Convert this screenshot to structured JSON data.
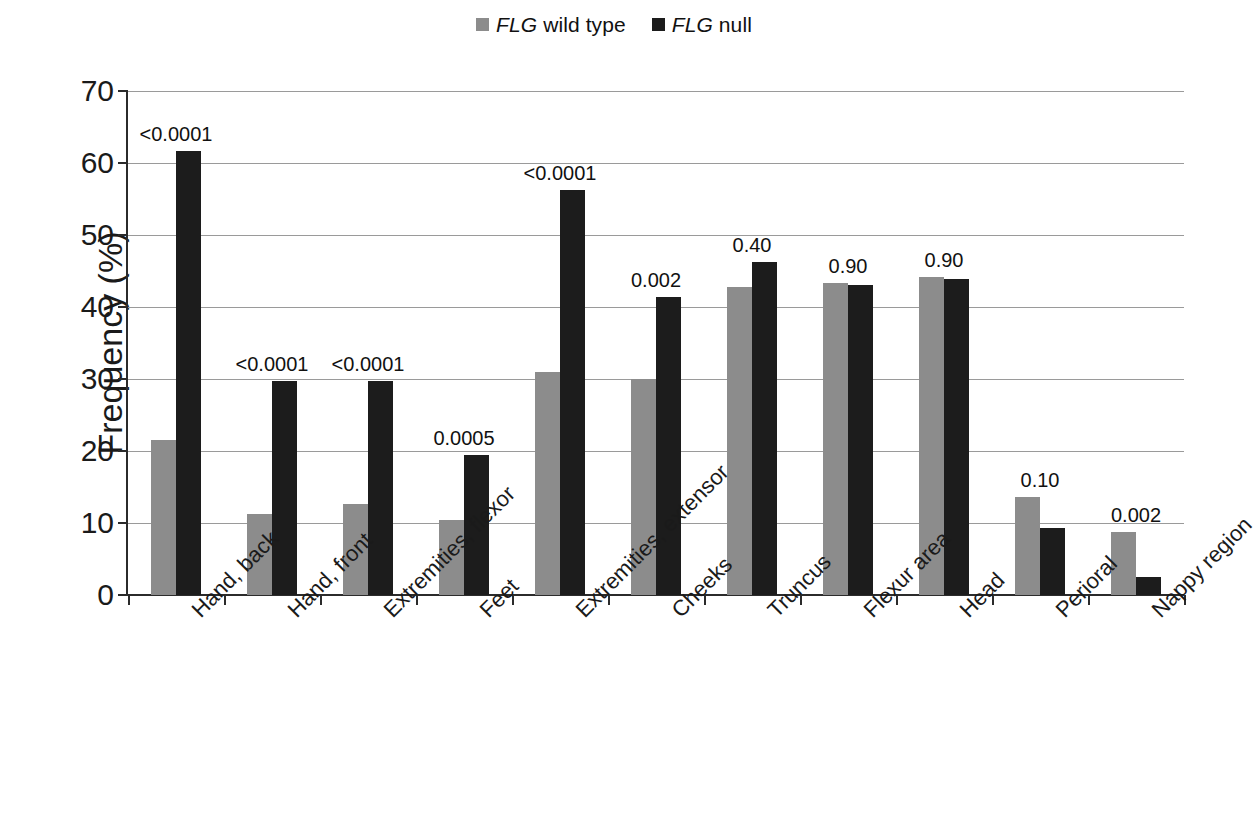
{
  "legend": {
    "items": [
      {
        "gene": "FLG",
        "rest": " wild type",
        "color": "#8c8c8c",
        "name": "legend-wild-type"
      },
      {
        "gene": "FLG",
        "rest": " null",
        "color": "#1c1c1c",
        "name": "legend-null"
      }
    ]
  },
  "axes": {
    "ylabel": "Frequency (%)",
    "yticks": [
      "0",
      "10",
      "20",
      "30",
      "40",
      "50",
      "60",
      "70"
    ]
  },
  "chart_data": {
    "type": "bar",
    "title": "",
    "xlabel": "",
    "ylabel": "Frequency (%)",
    "ylim": [
      0,
      70
    ],
    "ytick_step": 10,
    "grid": true,
    "legend_position": "top-center",
    "categories": [
      "Hand, back",
      "Hand, front",
      "Extremities, flexor",
      "Feet",
      "Extremities, extensor",
      "Cheeks",
      "Truncus",
      "Flexur area",
      "Head",
      "Perioral",
      "Nappy region"
    ],
    "series": [
      {
        "name": "FLG wild type",
        "color": "#8c8c8c",
        "values": [
          21.5,
          11.3,
          12.7,
          10.4,
          31.0,
          30.0,
          42.8,
          43.4,
          44.2,
          13.6,
          8.8
        ]
      },
      {
        "name": "FLG null",
        "color": "#1c1c1c",
        "values": [
          61.7,
          29.7,
          29.7,
          19.5,
          56.3,
          41.4,
          46.2,
          43.0,
          43.9,
          9.3,
          2.5
        ]
      }
    ],
    "annotations": {
      "label": "p-value",
      "values": [
        "<0.0001",
        "<0.0001",
        "<0.0001",
        "0.0005",
        "<0.0001",
        "0.002",
        "0.40",
        "0.90",
        "0.90",
        "0.10",
        "0.002"
      ]
    }
  }
}
